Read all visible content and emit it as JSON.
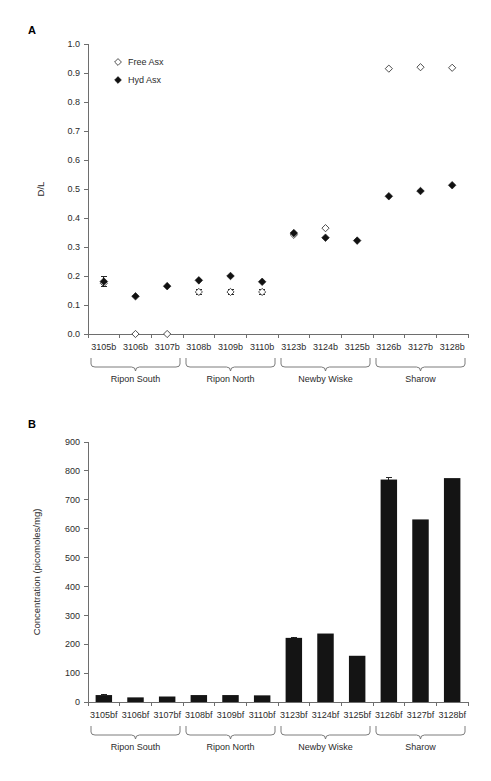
{
  "figure": {
    "panels": [
      {
        "letter": "A"
      },
      {
        "letter": "B"
      }
    ]
  },
  "panel_a": {
    "letter": "A",
    "legend": [
      {
        "label": "Free Asx",
        "marker": "open-diamond-icon"
      },
      {
        "label": "Hyd Asx",
        "marker": "filled-diamond-icon"
      }
    ],
    "y_axis_title": "D/L"
  },
  "panel_b": {
    "letter": "B",
    "y_axis_title": "Concentration (picomoles/mg)"
  },
  "chart_data": [
    {
      "type": "scatter",
      "panel": "A",
      "title": "",
      "xlabel": "",
      "ylabel": "D/L",
      "ylim": [
        0.0,
        1.0
      ],
      "yticks": [
        0.0,
        0.1,
        0.2,
        0.3,
        0.4,
        0.5,
        0.6,
        0.7,
        0.8,
        0.9,
        1.0
      ],
      "ytick_labels": [
        "0.0",
        "0.1",
        "0.2",
        "0.3",
        "0.4",
        "0.5",
        "0.6",
        "0.7",
        "0.8",
        "0.9",
        "1.0"
      ],
      "grid": false,
      "legend_position": "upper-left-inside",
      "categories": [
        "3105b",
        "3106b",
        "3107b",
        "3108b",
        "3109b",
        "3110b",
        "3123b",
        "3124b",
        "3125b",
        "3126b",
        "3127b",
        "3128b"
      ],
      "groups": [
        {
          "label": "Ripon South",
          "start": 0,
          "end": 2
        },
        {
          "label": "Ripon North",
          "start": 3,
          "end": 5
        },
        {
          "label": "Newby Wiske",
          "start": 6,
          "end": 8
        },
        {
          "label": "Sharow",
          "start": 9,
          "end": 11
        }
      ],
      "series": [
        {
          "name": "Free Asx",
          "marker": "open-diamond",
          "values": [
            0.175,
            0.0,
            0.0,
            0.145,
            0.145,
            0.145,
            0.342,
            0.365,
            null,
            0.915,
            0.92,
            0.918
          ],
          "errors": [
            0.0,
            0.0,
            0.0,
            0.008,
            0.008,
            0.008,
            0.0,
            0.0,
            null,
            0.0,
            0.0,
            0.0
          ]
        },
        {
          "name": "Hyd Asx",
          "marker": "filled-diamond",
          "values": [
            0.181,
            0.13,
            0.165,
            0.185,
            0.2,
            0.18,
            0.348,
            0.332,
            0.322,
            0.475,
            0.493,
            0.513
          ],
          "errors": [
            0.016,
            0.0,
            0.0,
            0.0,
            0.0,
            0.0,
            0.0,
            0.0,
            0.0,
            0.0,
            0.0,
            0.0
          ]
        }
      ]
    },
    {
      "type": "bar",
      "panel": "B",
      "title": "",
      "xlabel": "",
      "ylabel": "Concentration (picomoles/mg)",
      "ylim": [
        0,
        900
      ],
      "yticks": [
        0,
        100,
        200,
        300,
        400,
        500,
        600,
        700,
        800,
        900
      ],
      "ytick_labels": [
        "0",
        "100",
        "200",
        "300",
        "400",
        "500",
        "600",
        "700",
        "800",
        "900"
      ],
      "grid": false,
      "categories": [
        "3105bf",
        "3106bf",
        "3107bf",
        "3108bf",
        "3109bf",
        "3110bf",
        "3123bf",
        "3124bf",
        "3125bf",
        "3126bf",
        "3127bf",
        "3128bf"
      ],
      "groups": [
        {
          "label": "Ripon South",
          "start": 0,
          "end": 2
        },
        {
          "label": "Ripon North",
          "start": 3,
          "end": 5
        },
        {
          "label": "Newby Wiske",
          "start": 6,
          "end": 8
        },
        {
          "label": "Sharow",
          "start": 9,
          "end": 11
        }
      ],
      "values": [
        24,
        16,
        19,
        24,
        24,
        23,
        222,
        237,
        160,
        770,
        632,
        775
      ],
      "errors": [
        2,
        0,
        0,
        0,
        0,
        0,
        2,
        0,
        0,
        6,
        0,
        0
      ]
    }
  ]
}
